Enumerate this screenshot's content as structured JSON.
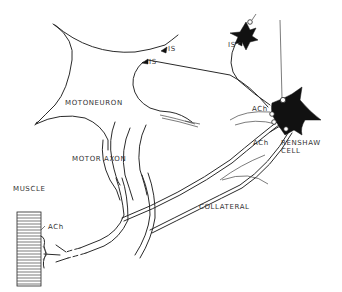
{
  "diagram": {
    "type": "neuroanatomy-schematic",
    "colors": {
      "line": "#2a2a2a",
      "fill_inhibitory": "#111111",
      "background": "#ffffff",
      "label": "#333333"
    },
    "labels": {
      "motoneuron": "MOTONEURON",
      "motor_axon": "MOTOR AXON",
      "muscle": "MUSCLE",
      "ach_endplate": "ACh",
      "collateral": "COLLATERAL",
      "ach_synapse_upper": "ACh",
      "ach_synapse_lower": "ACh",
      "renshaw_line1": "RENSHAW",
      "renshaw_line2": "CELL",
      "is_1": "IS",
      "is_2": "IS",
      "is_3": "IS"
    },
    "nodes": [
      {
        "id": "motoneuron",
        "label": "MOTONEURON",
        "shape": "outlined soma (large, star-shaped)"
      },
      {
        "id": "renshaw-cell",
        "label": "RENSHAW CELL",
        "shape": "filled black soma"
      },
      {
        "id": "inhibitory-interneuron",
        "label": "",
        "shape": "filled black soma (small)"
      },
      {
        "id": "muscle",
        "label": "MUSCLE",
        "shape": "striated block"
      }
    ],
    "edges": [
      {
        "from": "motoneuron",
        "to": "muscle",
        "label": "MOTOR AXON",
        "transmitter": "ACh"
      },
      {
        "from": "motoneuron",
        "to": "renshaw-cell",
        "label": "COLLATERAL",
        "transmitter": "ACh"
      },
      {
        "from": "renshaw-cell",
        "to": "motoneuron",
        "label": "IS",
        "type": "inhibitory synapse"
      },
      {
        "from": "inhibitory-interneuron",
        "to": "motoneuron",
        "label": "IS",
        "type": "inhibitory synapse"
      },
      {
        "from": "renshaw-cell",
        "to": "inhibitory-interneuron",
        "label": "IS",
        "type": "inhibitory synapse"
      }
    ]
  }
}
